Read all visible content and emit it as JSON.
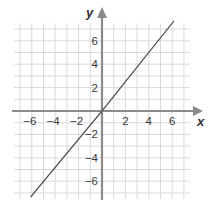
{
  "chart_data": {
    "type": "line",
    "title": "",
    "xlabel": "x",
    "ylabel": "y",
    "xlim": [
      -7.5,
      7.5
    ],
    "ylim": [
      -7.5,
      7.5
    ],
    "grid": true,
    "grid_step": 1,
    "x_ticks": [
      -6,
      -4,
      -2,
      2,
      4,
      6
    ],
    "y_ticks": [
      -6,
      -4,
      -2,
      2,
      4,
      6
    ],
    "x_tick_labels": [
      "−6",
      "−4",
      "−2",
      "2",
      "4",
      "6"
    ],
    "y_tick_labels": [
      "−6",
      "−4",
      "−2",
      "2",
      "4",
      "6"
    ],
    "legend": null,
    "series": [
      {
        "name": "line through origin",
        "equation": "y = 1.2x",
        "x": [
          -6.1,
          0,
          6.15
        ],
        "y": [
          -7.35,
          0,
          7.7
        ]
      }
    ]
  },
  "colors": {
    "axis": "#8a8a8a",
    "grid": "#d9d9d9",
    "line": "#555555",
    "text": "#3a3a3a"
  },
  "layout": {
    "origin_px": [
      102,
      111
    ],
    "unit_px": 11.7
  }
}
